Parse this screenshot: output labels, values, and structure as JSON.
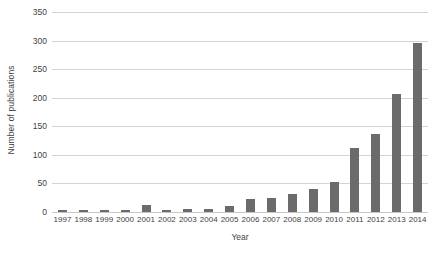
{
  "chart_data": {
    "type": "bar",
    "title": "",
    "xlabel": "Year",
    "ylabel": "Number of publications",
    "categories": [
      "1997",
      "1998",
      "1999",
      "2000",
      "2001",
      "2002",
      "2003",
      "2004",
      "2005",
      "2006",
      "2007",
      "2008",
      "2009",
      "2010",
      "2011",
      "2012",
      "2013",
      "2014"
    ],
    "values": [
      3,
      3,
      4,
      3,
      12,
      4,
      6,
      6,
      10,
      22,
      25,
      31,
      40,
      53,
      112,
      137,
      207,
      296
    ],
    "series": [
      {
        "name": "Number of publications",
        "values": [
          3,
          3,
          4,
          3,
          12,
          4,
          6,
          6,
          10,
          22,
          25,
          31,
          40,
          53,
          112,
          137,
          207,
          296
        ]
      }
    ],
    "ylim": [
      0,
      350
    ],
    "ytick_values": [
      0,
      50,
      100,
      150,
      200,
      250,
      300,
      350
    ],
    "ytick_labels": [
      "0",
      "50",
      "100",
      "150",
      "200",
      "250",
      "300",
      "350"
    ],
    "grid": "horizontal",
    "legend": "none",
    "bar_color": "#6b6b6b",
    "gridline_color": "#d4d4d4",
    "background_color": "#ffffff"
  }
}
